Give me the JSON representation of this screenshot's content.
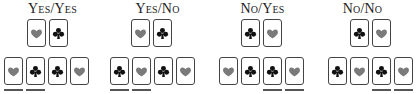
{
  "colors": {
    "heart": "#7a7a7a",
    "club": "#111111",
    "border": "#444444",
    "underline": "#555555"
  },
  "groups": [
    {
      "label": "Yes/Yes",
      "left": 0,
      "top": [
        {
          "suit": "heart",
          "x": 27
        },
        {
          "suit": "club",
          "x": 49
        }
      ],
      "bottom": [
        {
          "suit": "heart",
          "x": 4,
          "underline": true
        },
        {
          "suit": "club",
          "x": 26,
          "underline": true
        },
        {
          "suit": "club",
          "x": 48,
          "underline": false
        },
        {
          "suit": "heart",
          "x": 70,
          "underline": false
        }
      ]
    },
    {
      "label": "Yes/No",
      "left": 105,
      "top": [
        {
          "suit": "heart",
          "x": 26
        },
        {
          "suit": "club",
          "x": 48
        }
      ],
      "bottom": [
        {
          "suit": "club",
          "x": 5,
          "underline": true
        },
        {
          "suit": "heart",
          "x": 27,
          "underline": true
        },
        {
          "suit": "club",
          "x": 49,
          "underline": false
        },
        {
          "suit": "heart",
          "x": 71,
          "underline": false
        }
      ]
    },
    {
      "label": "No/Yes",
      "left": 210,
      "top": [
        {
          "suit": "club",
          "x": 31
        },
        {
          "suit": "heart",
          "x": 53
        }
      ],
      "bottom": [
        {
          "suit": "heart",
          "x": 9,
          "underline": false
        },
        {
          "suit": "club",
          "x": 31,
          "underline": false
        },
        {
          "suit": "club",
          "x": 53,
          "underline": true
        },
        {
          "suit": "heart",
          "x": 75,
          "underline": true
        }
      ]
    },
    {
      "label": "No/No",
      "left": 310,
      "top": [
        {
          "suit": "club",
          "x": 40
        },
        {
          "suit": "heart",
          "x": 62
        }
      ],
      "bottom": [
        {
          "suit": "club",
          "x": 18,
          "underline": false
        },
        {
          "suit": "heart",
          "x": 40,
          "underline": false
        },
        {
          "suit": "club",
          "x": 62,
          "underline": true
        },
        {
          "suit": "heart",
          "x": 84,
          "underline": true
        }
      ]
    }
  ]
}
